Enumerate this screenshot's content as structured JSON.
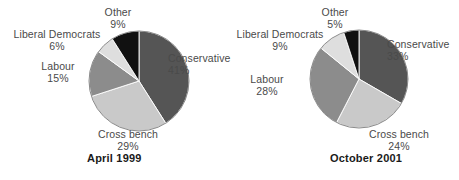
{
  "figure": {
    "background": "#ffffff",
    "label_color": "#4a4a4a",
    "title_color": "#1a1a1a"
  },
  "chart_data": [
    {
      "type": "pie",
      "title": "April 1999",
      "xlabel": "",
      "ylabel": "",
      "categories": [
        "Conservative",
        "Cross bench",
        "Labour",
        "Liberal Democrats",
        "Other"
      ],
      "values": [
        41,
        29,
        15,
        6,
        9
      ],
      "value_labels": [
        "41%",
        "29%",
        "15%",
        "6%",
        "9%"
      ],
      "colors": [
        "#555555",
        "#c9c9c9",
        "#8c8c8c",
        "#dedede",
        "#111111"
      ],
      "start_angle_deg": 0,
      "direction": "clockwise",
      "legend": "none",
      "grid": false
    },
    {
      "type": "pie",
      "title": "October 2001",
      "xlabel": "",
      "ylabel": "",
      "categories": [
        "Conservative",
        "Cross bench",
        "Labour",
        "Liberal Democrats",
        "Other"
      ],
      "values": [
        33,
        24,
        28,
        9,
        5
      ],
      "value_labels": [
        "33%",
        "24%",
        "28%",
        "9%",
        "5%"
      ],
      "colors": [
        "#555555",
        "#c9c9c9",
        "#8c8c8c",
        "#dedede",
        "#111111"
      ],
      "start_angle_deg": 0,
      "direction": "clockwise",
      "legend": "none",
      "grid": false
    }
  ],
  "layout": {
    "charts": [
      {
        "cx": 139,
        "cy": 81,
        "r": 50,
        "title_x": 87,
        "title_y": 152,
        "labels": [
          {
            "x": 168,
            "y": 52,
            "w": 90,
            "align": "left"
          },
          {
            "x": 83,
            "y": 128,
            "w": 90,
            "align": "center"
          },
          {
            "x": 23,
            "y": 60,
            "w": 70,
            "align": "center"
          },
          {
            "x": 2,
            "y": 28,
            "w": 110,
            "align": "center"
          },
          {
            "x": 88,
            "y": 6,
            "w": 60,
            "align": "center"
          }
        ]
      },
      {
        "cx": 129,
        "cy": 79,
        "r": 49,
        "title_x": 100,
        "title_y": 152,
        "labels": [
          {
            "x": 157,
            "y": 38,
            "w": 86,
            "align": "left"
          },
          {
            "x": 125,
            "y": 128,
            "w": 88,
            "align": "center"
          },
          {
            "x": 2,
            "y": 73,
            "w": 70,
            "align": "center"
          },
          {
            "x": -5,
            "y": 28,
            "w": 110,
            "align": "center"
          },
          {
            "x": 75,
            "y": 6,
            "w": 60,
            "align": "center"
          }
        ]
      }
    ]
  }
}
